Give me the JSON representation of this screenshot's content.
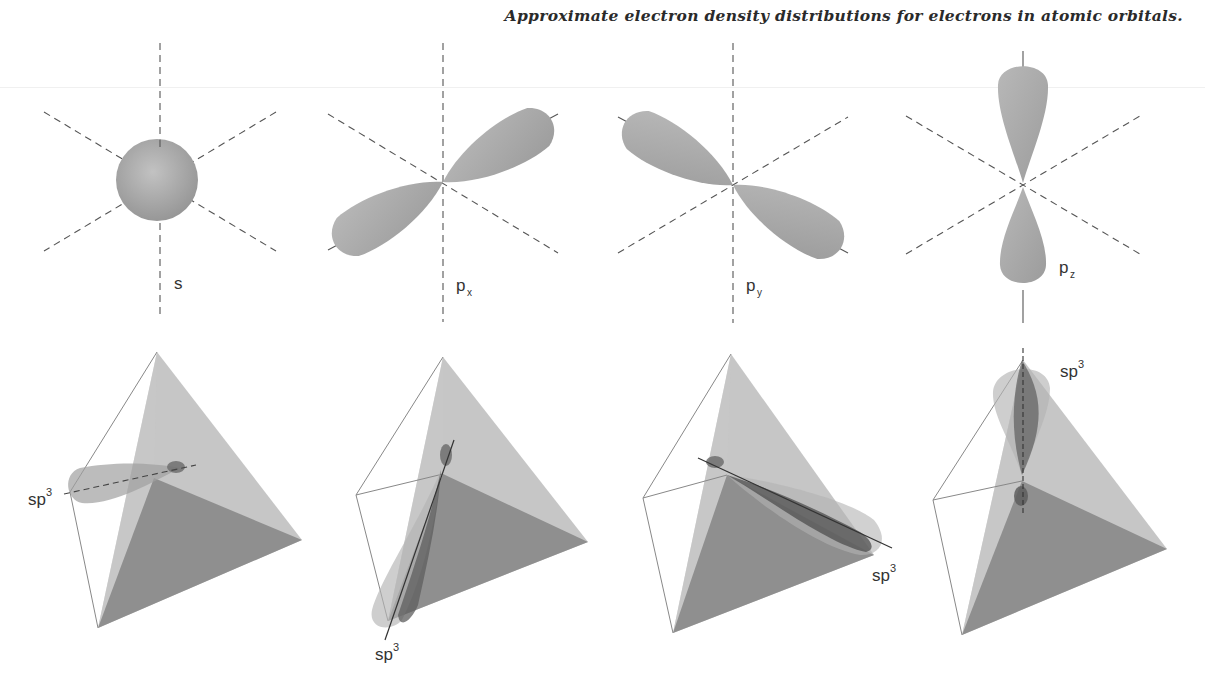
{
  "caption": "Approximate electron density distributions for electrons in atomic orbitals.",
  "orbitals": [
    {
      "label_main": "s",
      "label_sub": ""
    },
    {
      "label_main": "p",
      "label_sub": "x"
    },
    {
      "label_main": "p",
      "label_sub": "y"
    },
    {
      "label_main": "p",
      "label_sub": "z"
    }
  ],
  "hybrids": [
    {
      "label_main": "sp",
      "label_sup": "3"
    },
    {
      "label_main": "sp",
      "label_sup": "3"
    },
    {
      "label_main": "sp",
      "label_sup": "3"
    },
    {
      "label_main": "sp",
      "label_sup": "3"
    }
  ],
  "colors": {
    "lobe": "#a9a9a9",
    "face_light": "#bdbdbd",
    "face_dark": "#8e8e8e",
    "axis": "#555555",
    "edge": "#777777"
  }
}
